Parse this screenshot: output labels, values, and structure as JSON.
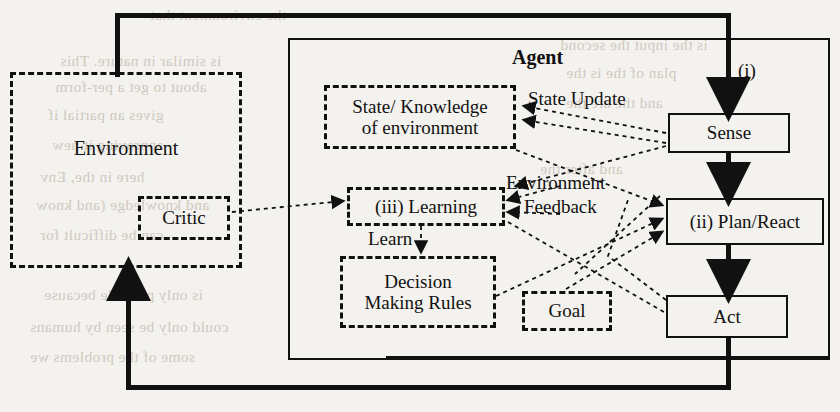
{
  "diagram": {
    "agent_label": "Agent",
    "loop_label_i": "(i)",
    "nodes": {
      "environment": "Environment",
      "critic": "Critic",
      "state_knowledge": "State/ Knowledge\nof environment",
      "state_knowledge_line1": "State/ Knowledge",
      "state_knowledge_line2": "of environment",
      "learning": "(iii) Learning",
      "decision_rules_line1": "Decision",
      "decision_rules_line2": "Making Rules",
      "goal": "Goal",
      "sense": "Sense",
      "plan_react": "(ii) Plan/React",
      "act": "Act"
    },
    "edge_labels": {
      "state_update": "State Update",
      "environment_feedback_line1": "Environment",
      "environment_feedback_line2": "Feedback",
      "learn": "Learn"
    },
    "colors": {
      "ink": "#111111",
      "page": "#f4f2ee",
      "showthrough": "#c9c3b8"
    },
    "showthrough_text": [
      "the environment that",
      "is similar in nature. This",
      "about to get a per-form",
      "gives an partial if",
      "approving it new",
      "here in the, Env",
      "and knowledge (and know",
      "can be difficult for",
      "is only possible because",
      "could only be seen by humans",
      "some of the problems we",
      "is the input the second",
      "plan of the is the",
      "and the are the",
      "and after the"
    ]
  }
}
